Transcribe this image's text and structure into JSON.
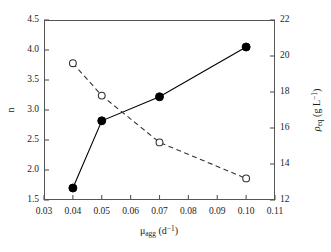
{
  "chart_data": {
    "type": "line",
    "title": "",
    "xlabel": "μ_agg (d⁻¹)",
    "ylabel": "n",
    "y2label": "ρ_eq (g L⁻¹)",
    "xlim": [
      0.03,
      0.11
    ],
    "ylim": [
      1.5,
      4.5
    ],
    "y2lim": [
      12,
      22
    ],
    "grid": false,
    "legend": "none",
    "x_ticks": [
      "0.03",
      "0.04",
      "0.05",
      "0.06",
      "0.07",
      "0.08",
      "0.09",
      "0.10",
      "0.11"
    ],
    "x_tick_values": [
      0.03,
      0.04,
      0.05,
      0.06,
      0.07,
      0.08,
      0.09,
      0.1,
      0.11
    ],
    "y_ticks": [
      "1.5",
      "2.0",
      "2.5",
      "3.0",
      "3.5",
      "4.0",
      "4.5"
    ],
    "y_tick_values": [
      1.5,
      2.0,
      2.5,
      3.0,
      3.5,
      4.0,
      4.5
    ],
    "y2_ticks": [
      "12",
      "14",
      "16",
      "18",
      "20",
      "22"
    ],
    "y2_tick_values": [
      12,
      14,
      16,
      18,
      20,
      22
    ],
    "series": [
      {
        "name": "n",
        "axis": "left",
        "marker": "filled-circle",
        "linestyle": "solid",
        "color": "#000000",
        "x": [
          0.04,
          0.05,
          0.07,
          0.1
        ],
        "values": [
          1.7,
          2.82,
          3.22,
          4.05
        ]
      },
      {
        "name": "ρ_eq",
        "axis": "right",
        "marker": "open-circle",
        "linestyle": "dashed",
        "color": "#333333",
        "x": [
          0.04,
          0.05,
          0.07,
          0.1
        ],
        "values": [
          19.6,
          17.8,
          15.2,
          13.2
        ]
      }
    ]
  },
  "labels": {
    "y_left_title": "n",
    "x_title_base": "μ",
    "x_title_sub": "agg",
    "x_title_unit_open": " (d",
    "x_title_unit_sup": "−1",
    "x_title_unit_close": ")",
    "y_right_base": "ρ",
    "y_right_sub": "eq",
    "y_right_unit_open": " (g L",
    "y_right_unit_sup": "−1",
    "y_right_unit_close": ")"
  },
  "style": {
    "frame_color": "#555555",
    "tick_color": "#555555",
    "series1_color": "#000000",
    "series2_color": "#333333",
    "background": "#ffffff"
  }
}
